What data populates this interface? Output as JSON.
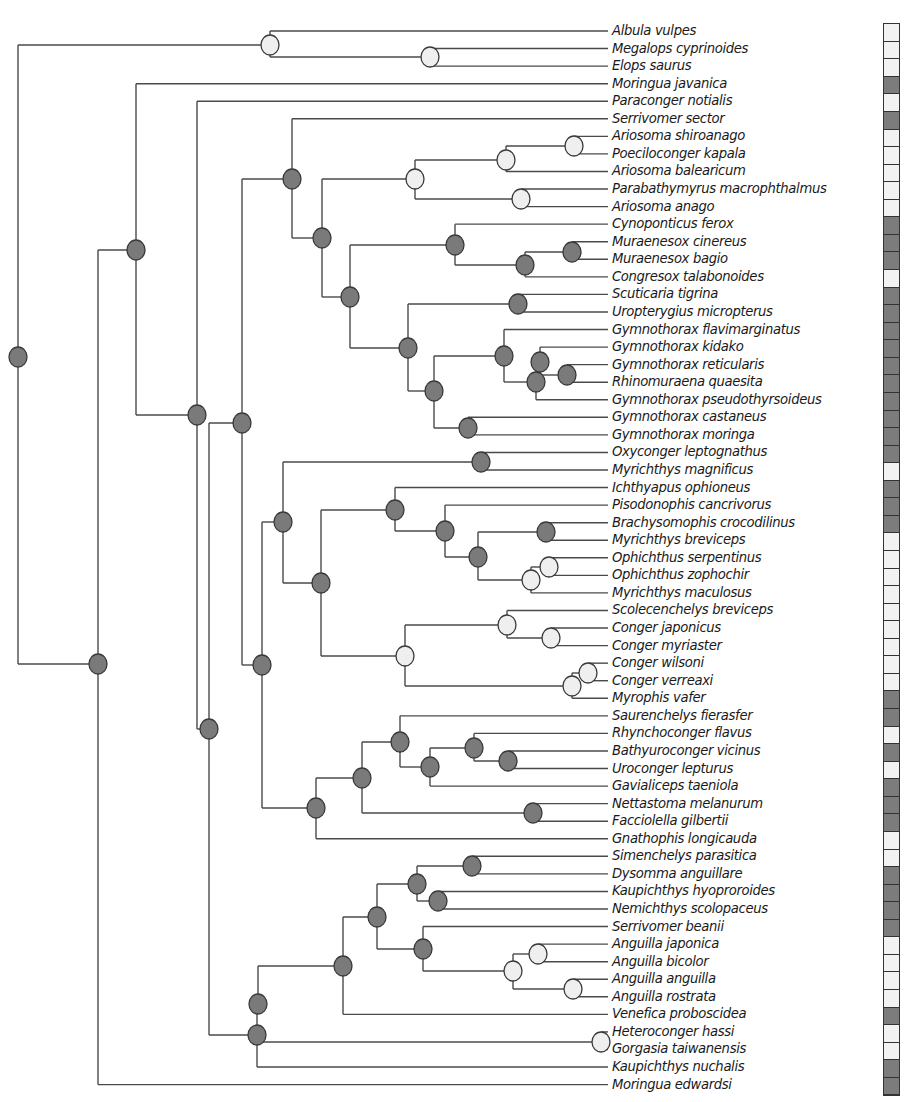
{
  "figure": {
    "type": "phylogenetic-tree",
    "colors": {
      "branch": "#4a4a4a",
      "node_dark": "#7a7a7a",
      "node_light": "#efefef",
      "node_stroke": "#3a3a3a",
      "strip_dark": "#7c7c7c",
      "strip_light": "#f2f2f2"
    },
    "tip_x": 608,
    "row_top": 31,
    "row_step": 17.56
  },
  "tips": [
    {
      "label": "Albula vulpes",
      "state": "light"
    },
    {
      "label": "Megalops cyprinoides",
      "state": "light"
    },
    {
      "label": "Elops saurus",
      "state": "light"
    },
    {
      "label": "Moringua javanica",
      "state": "dark"
    },
    {
      "label": "Paraconger notialis",
      "state": "light"
    },
    {
      "label": "Serrivomer sector",
      "state": "dark"
    },
    {
      "label": "Ariosoma shiroanago",
      "state": "light"
    },
    {
      "label": "Poeciloconger kapala",
      "state": "light"
    },
    {
      "label": "Ariosoma balearicum",
      "state": "light"
    },
    {
      "label": "Parabathymyrus macrophthalmus",
      "state": "light"
    },
    {
      "label": "Ariosoma anago",
      "state": "light"
    },
    {
      "label": "Cynoponticus ferox",
      "state": "dark"
    },
    {
      "label": "Muraenesox cinereus",
      "state": "dark"
    },
    {
      "label": "Muraenesox bagio",
      "state": "dark"
    },
    {
      "label": "Congresox talabonoides",
      "state": "light"
    },
    {
      "label": "Scuticaria tigrina",
      "state": "dark"
    },
    {
      "label": "Uropterygius micropterus",
      "state": "dark"
    },
    {
      "label": "Gymnothorax flavimarginatus",
      "state": "dark"
    },
    {
      "label": "Gymnothorax kidako",
      "state": "dark"
    },
    {
      "label": "Gymnothorax reticularis",
      "state": "dark"
    },
    {
      "label": "Rhinomuraena quaesita",
      "state": "dark"
    },
    {
      "label": "Gymnothorax pseudothyrsoideus",
      "state": "dark"
    },
    {
      "label": "Gymnothorax castaneus",
      "state": "dark"
    },
    {
      "label": "Gymnothorax moringa",
      "state": "dark"
    },
    {
      "label": "Oxyconger leptognathus",
      "state": "dark"
    },
    {
      "label": "Myrichthys magnificus",
      "state": "light"
    },
    {
      "label": "Ichthyapus ophioneus",
      "state": "dark"
    },
    {
      "label": "Pisodonophis cancrivorus",
      "state": "dark"
    },
    {
      "label": "Brachysomophis crocodilinus",
      "state": "dark"
    },
    {
      "label": "Myrichthys breviceps",
      "state": "light"
    },
    {
      "label": "Ophichthus serpentinus",
      "state": "light"
    },
    {
      "label": "Ophichthus zophochir",
      "state": "light"
    },
    {
      "label": "Myrichthys maculosus",
      "state": "light"
    },
    {
      "label": "Scolecenchelys breviceps",
      "state": "light"
    },
    {
      "label": "Conger japonicus",
      "state": "light"
    },
    {
      "label": "Conger myriaster",
      "state": "light"
    },
    {
      "label": "Conger wilsoni",
      "state": "light"
    },
    {
      "label": "Conger verreaxi",
      "state": "light"
    },
    {
      "label": "Myrophis vafer",
      "state": "dark"
    },
    {
      "label": "Saurenchelys fierasfer",
      "state": "dark"
    },
    {
      "label": "Rhynchoconger flavus",
      "state": "light"
    },
    {
      "label": "Bathyuroconger vicinus",
      "state": "dark"
    },
    {
      "label": "Uroconger lepturus",
      "state": "light"
    },
    {
      "label": "Gavialiceps taeniola",
      "state": "dark"
    },
    {
      "label": "Nettastoma melanurum",
      "state": "dark"
    },
    {
      "label": "Facciolella gilbertii",
      "state": "dark"
    },
    {
      "label": "Gnathophis longicauda",
      "state": "light"
    },
    {
      "label": "Simenchelys parasitica",
      "state": "light"
    },
    {
      "label": "Dysomma anguillare",
      "state": "dark"
    },
    {
      "label": "Kaupichthys hyoproroides",
      "state": "dark"
    },
    {
      "label": "Nemichthys scolopaceus",
      "state": "dark"
    },
    {
      "label": "Serrivomer beanii",
      "state": "dark"
    },
    {
      "label": "Anguilla japonica",
      "state": "light"
    },
    {
      "label": "Anguilla bicolor",
      "state": "light"
    },
    {
      "label": "Anguilla anguilla",
      "state": "light"
    },
    {
      "label": "Anguilla rostrata",
      "state": "light"
    },
    {
      "label": "Venefica proboscidea",
      "state": "dark"
    },
    {
      "label": "Heteroconger hassi",
      "state": "light"
    },
    {
      "label": "Gorgasia taiwanensis",
      "state": "light"
    },
    {
      "label": "Kaupichthys nuchalis",
      "state": "dark"
    },
    {
      "label": "Moringua edwardsi",
      "state": "dark"
    }
  ],
  "nodes": [
    {
      "id": "root",
      "x": 18,
      "y": 357,
      "state": "dark",
      "children": [
        "n_out",
        "n_A"
      ]
    },
    {
      "id": "n_out",
      "x": 270,
      "y": 45,
      "state": "light",
      "children": [
        "t0",
        "n_me"
      ]
    },
    {
      "id": "n_me",
      "x": 430,
      "y": 57,
      "state": "light",
      "children": [
        "t1",
        "t2"
      ]
    },
    {
      "id": "n_A",
      "x": 98,
      "y": 664,
      "state": "dark",
      "children": [
        "n_B",
        "t60"
      ]
    },
    {
      "id": "n_B",
      "x": 136,
      "y": 250,
      "state": "dark",
      "children": [
        "t3",
        "n_C"
      ]
    },
    {
      "id": "n_C",
      "x": 197,
      "y": 415,
      "state": "dark",
      "children": [
        "t4",
        "n_D"
      ]
    },
    {
      "id": "n_D",
      "x": 209,
      "y": 729,
      "state": "dark",
      "children": [
        "n_E",
        "n_Z"
      ]
    },
    {
      "id": "n_E",
      "x": 242,
      "y": 423,
      "state": "dark",
      "children": [
        "n_F",
        "n_O"
      ]
    },
    {
      "id": "n_F",
      "x": 292,
      "y": 179,
      "state": "dark",
      "children": [
        "t5",
        "n_G"
      ]
    },
    {
      "id": "n_G",
      "x": 322,
      "y": 238,
      "state": "dark",
      "children": [
        "n_H",
        "n_J"
      ]
    },
    {
      "id": "n_H",
      "x": 415,
      "y": 179,
      "state": "light",
      "children": [
        "n_H1",
        "n_H2"
      ]
    },
    {
      "id": "n_H1",
      "x": 506,
      "y": 160,
      "state": "light",
      "children": [
        "n_H1a",
        "t8"
      ]
    },
    {
      "id": "n_H1a",
      "x": 574,
      "y": 146,
      "state": "light",
      "children": [
        "t6",
        "t7"
      ]
    },
    {
      "id": "n_H2",
      "x": 521,
      "y": 199,
      "state": "light",
      "children": [
        "t9",
        "t10"
      ]
    },
    {
      "id": "n_J",
      "x": 350,
      "y": 297,
      "state": "dark",
      "children": [
        "n_K",
        "n_L"
      ]
    },
    {
      "id": "n_K",
      "x": 455,
      "y": 245,
      "state": "dark",
      "children": [
        "t11",
        "n_K1"
      ]
    },
    {
      "id": "n_K1",
      "x": 525,
      "y": 265,
      "state": "dark",
      "children": [
        "n_K2",
        "t14"
      ]
    },
    {
      "id": "n_K2",
      "x": 572,
      "y": 252,
      "state": "dark",
      "children": [
        "t12",
        "t13"
      ]
    },
    {
      "id": "n_L",
      "x": 408,
      "y": 348,
      "state": "dark",
      "children": [
        "n_L1",
        "n_L2"
      ]
    },
    {
      "id": "n_L1",
      "x": 518,
      "y": 304,
      "state": "dark",
      "children": [
        "t15",
        "t16"
      ]
    },
    {
      "id": "n_L2",
      "x": 434,
      "y": 391,
      "state": "dark",
      "children": [
        "n_L3",
        "n_L6"
      ]
    },
    {
      "id": "n_L3",
      "x": 504,
      "y": 356,
      "state": "dark",
      "children": [
        "t17",
        "n_L4"
      ]
    },
    {
      "id": "n_L4",
      "x": 536,
      "y": 382,
      "state": "dark",
      "children": [
        "n_L4a",
        "t21"
      ]
    },
    {
      "id": "n_L4a",
      "x": 540,
      "y": 362,
      "state": "dark",
      "children": [
        "t18",
        "n_L5"
      ]
    },
    {
      "id": "n_L5",
      "x": 567,
      "y": 375,
      "state": "dark",
      "children": [
        "t19",
        "t20"
      ]
    },
    {
      "id": "n_L6",
      "x": 468,
      "y": 428,
      "state": "dark",
      "children": [
        "t22",
        "t23"
      ]
    },
    {
      "id": "n_O",
      "x": 262,
      "y": 665,
      "state": "dark",
      "children": [
        "n_P",
        "n_V"
      ]
    },
    {
      "id": "n_P",
      "x": 283,
      "y": 522,
      "state": "dark",
      "children": [
        "n_P1",
        "n_Q"
      ]
    },
    {
      "id": "n_P1",
      "x": 481,
      "y": 462,
      "state": "dark",
      "children": [
        "t24",
        "t25"
      ]
    },
    {
      "id": "n_Q",
      "x": 321,
      "y": 583,
      "state": "dark",
      "children": [
        "n_R",
        "n_S"
      ]
    },
    {
      "id": "n_R",
      "x": 395,
      "y": 510,
      "state": "dark",
      "children": [
        "t26",
        "n_R1"
      ]
    },
    {
      "id": "n_R1",
      "x": 445,
      "y": 531,
      "state": "dark",
      "children": [
        "t27",
        "n_R2"
      ]
    },
    {
      "id": "n_R2",
      "x": 478,
      "y": 557,
      "state": "dark",
      "children": [
        "n_R3",
        "n_R4"
      ]
    },
    {
      "id": "n_R3",
      "x": 546,
      "y": 532,
      "state": "dark",
      "children": [
        "t28",
        "t29"
      ]
    },
    {
      "id": "n_R4",
      "x": 531,
      "y": 580,
      "state": "light",
      "children": [
        "n_R5",
        "t32"
      ]
    },
    {
      "id": "n_R5",
      "x": 549,
      "y": 567,
      "state": "light",
      "children": [
        "t30",
        "t31"
      ]
    },
    {
      "id": "n_S",
      "x": 405,
      "y": 656,
      "state": "light",
      "children": [
        "n_S1",
        "n_S3"
      ]
    },
    {
      "id": "n_S1",
      "x": 507,
      "y": 625,
      "state": "light",
      "children": [
        "t33",
        "n_S2"
      ]
    },
    {
      "id": "n_S2",
      "x": 551,
      "y": 638,
      "state": "light",
      "children": [
        "t34",
        "t35"
      ]
    },
    {
      "id": "n_S3",
      "x": 572,
      "y": 686,
      "state": "light",
      "children": [
        "n_S4",
        "t38"
      ]
    },
    {
      "id": "n_S4",
      "x": 588,
      "y": 673,
      "state": "light",
      "children": [
        "t36",
        "t37"
      ]
    },
    {
      "id": "n_V",
      "x": 316,
      "y": 808,
      "state": "dark",
      "children": [
        "n_W",
        "t46"
      ]
    },
    {
      "id": "n_W",
      "x": 362,
      "y": 778,
      "state": "dark",
      "children": [
        "n_X",
        "n_W2"
      ]
    },
    {
      "id": "n_X",
      "x": 400,
      "y": 742,
      "state": "dark",
      "children": [
        "t39",
        "n_X1"
      ]
    },
    {
      "id": "n_X1",
      "x": 430,
      "y": 767,
      "state": "dark",
      "children": [
        "n_X2",
        "t43"
      ]
    },
    {
      "id": "n_X2",
      "x": 474,
      "y": 748,
      "state": "dark",
      "children": [
        "t40",
        "n_X3"
      ]
    },
    {
      "id": "n_X3",
      "x": 508,
      "y": 761,
      "state": "dark",
      "children": [
        "t41",
        "t42"
      ]
    },
    {
      "id": "n_W2",
      "x": 533,
      "y": 813,
      "state": "dark",
      "children": [
        "t44",
        "t45"
      ]
    },
    {
      "id": "n_Z",
      "x": 257,
      "y": 1035,
      "state": "dark",
      "children": [
        "n_Z1",
        "n_HG",
        "t59"
      ]
    },
    {
      "id": "n_Z1",
      "x": 258,
      "y": 1004,
      "state": "dark",
      "children": [
        "n_Y"
      ]
    },
    {
      "id": "n_Y",
      "x": 343,
      "y": 966,
      "state": "dark",
      "children": [
        "n_Y1",
        "t56"
      ]
    },
    {
      "id": "n_Y1",
      "x": 377,
      "y": 917,
      "state": "dark",
      "children": [
        "n_Y2",
        "n_Y5"
      ]
    },
    {
      "id": "n_Y2",
      "x": 417,
      "y": 884,
      "state": "dark",
      "children": [
        "n_Y3",
        "n_Y4"
      ]
    },
    {
      "id": "n_Y3",
      "x": 472,
      "y": 866,
      "state": "dark",
      "children": [
        "t47",
        "t48"
      ]
    },
    {
      "id": "n_Y4",
      "x": 438,
      "y": 901,
      "state": "dark",
      "children": [
        "t49",
        "t50"
      ]
    },
    {
      "id": "n_Y5",
      "x": 423,
      "y": 949,
      "state": "dark",
      "children": [
        "t51",
        "n_Y6"
      ]
    },
    {
      "id": "n_Y6",
      "x": 513,
      "y": 971,
      "state": "light",
      "children": [
        "n_Y7",
        "n_Y8"
      ]
    },
    {
      "id": "n_Y7",
      "x": 538,
      "y": 954,
      "state": "light",
      "children": [
        "t52",
        "t53"
      ]
    },
    {
      "id": "n_Y8",
      "x": 573,
      "y": 989,
      "state": "light",
      "children": [
        "t54",
        "t55"
      ]
    },
    {
      "id": "n_HG",
      "x": 601,
      "y": 1042,
      "state": "light",
      "children": [
        "t57",
        "t58"
      ]
    }
  ]
}
